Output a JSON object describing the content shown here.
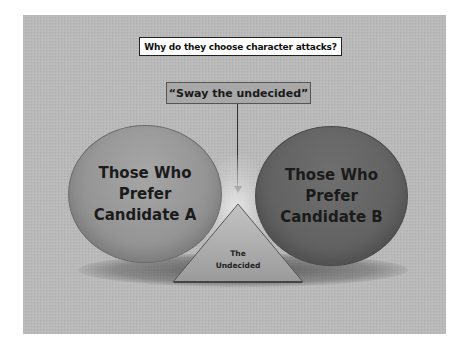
{
  "title": "Why do they choose character attacks?",
  "callout": "“Sway the undecided”",
  "groups": {
    "left": {
      "line1": "Those Who",
      "line2": "Prefer",
      "line3": "Candidate A",
      "color": "#959595"
    },
    "right": {
      "line1": "Those Who",
      "line2": "Prefer",
      "line3": "Candidate B",
      "color": "#636363"
    },
    "center": {
      "line1": "The",
      "line2": "Undecided",
      "color": "#a9a9a9"
    }
  },
  "colors": {
    "slide_background": "#b9b9b9",
    "title_box_background": "#ffffff",
    "callout_box_background": "#a8a8a8",
    "arrow": "#333333"
  }
}
